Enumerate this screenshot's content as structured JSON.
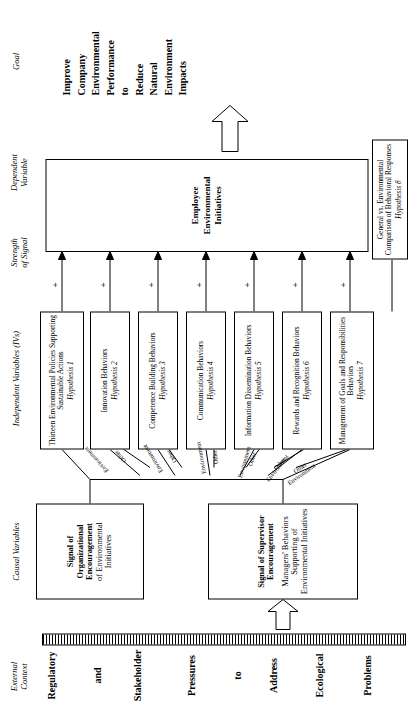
{
  "figure": {
    "column_headers": {
      "external_context": "External\nContext",
      "causal_variables": "Causal Variables",
      "independent_variables": "Independent Variables (IVs)",
      "strength_of_signal": "Strength\nof Signal",
      "dependent_variable": "Dependent\nVariable",
      "goal": "Goal"
    },
    "external_context_items": [
      "Regulatory",
      "and",
      "Stakeholder",
      "Pressures",
      "to",
      "Address",
      "Ecological",
      "Problems"
    ],
    "causal_variables": [
      {
        "name": "signal-of-organizational-encouragement",
        "lines": [
          "Signal of",
          "Organizational",
          "Encouragement",
          "of Environmental",
          "Initiatives"
        ],
        "bold_lines": 3
      },
      {
        "name": "signal-of-supervisor-encouragement",
        "lines": [
          "Signal of Supervisor",
          "Encouragement",
          "Managers' Behaviors",
          "Supporting of",
          "Environmental Initiatives"
        ],
        "bold_lines": 2
      }
    ],
    "independent_variables": [
      {
        "title": "Thirteen Environmental Policies Supporting Sustainable Actions",
        "hypothesis": "Hypothesis 1"
      },
      {
        "title": "Innovation Behaviors",
        "hypothesis": "Hypothesis 2"
      },
      {
        "title": "Competence Building Behaviors",
        "hypothesis": "Hypothesis 3"
      },
      {
        "title": "Communication Behaviors",
        "hypothesis": "Hypothesis 4"
      },
      {
        "title": "Information Dissemination Behaviors",
        "hypothesis": "Hypothesis 5"
      },
      {
        "title": "Rewards and Recognition Behaviors",
        "hypothesis": "Hypothesis 6"
      },
      {
        "title": "Management of Goals and Responsibilities Behaviors",
        "hypothesis": "Hypothesis 7"
      }
    ],
    "comparison_box": {
      "title": "General vs. Environmental Comparison of Behavioral Responses",
      "hypothesis": "Hypothesis 8"
    },
    "signal_strength_markers": [
      "+",
      "+",
      "+",
      "+",
      "+",
      "+",
      "+"
    ],
    "connector_labels": [
      "Environment",
      "Other",
      "Environment",
      "Other",
      "Environment",
      "Other",
      "Environment",
      "Other",
      "Environment",
      "Other",
      "Environment",
      "Other"
    ],
    "dependent_variable": {
      "lines": [
        "Employee",
        "Environmental",
        "Initiatives"
      ]
    },
    "goal_text": "Improve Company Environmental Performance to Reduce Natural Environment Impacts",
    "goal_lines": [
      "Improve",
      "Company",
      "Environmental",
      "Performance",
      "to",
      "Reduce",
      "Natural",
      "Environment",
      "Impacts"
    ],
    "colors": {
      "ink": "#000000",
      "paper": "#ffffff"
    }
  }
}
